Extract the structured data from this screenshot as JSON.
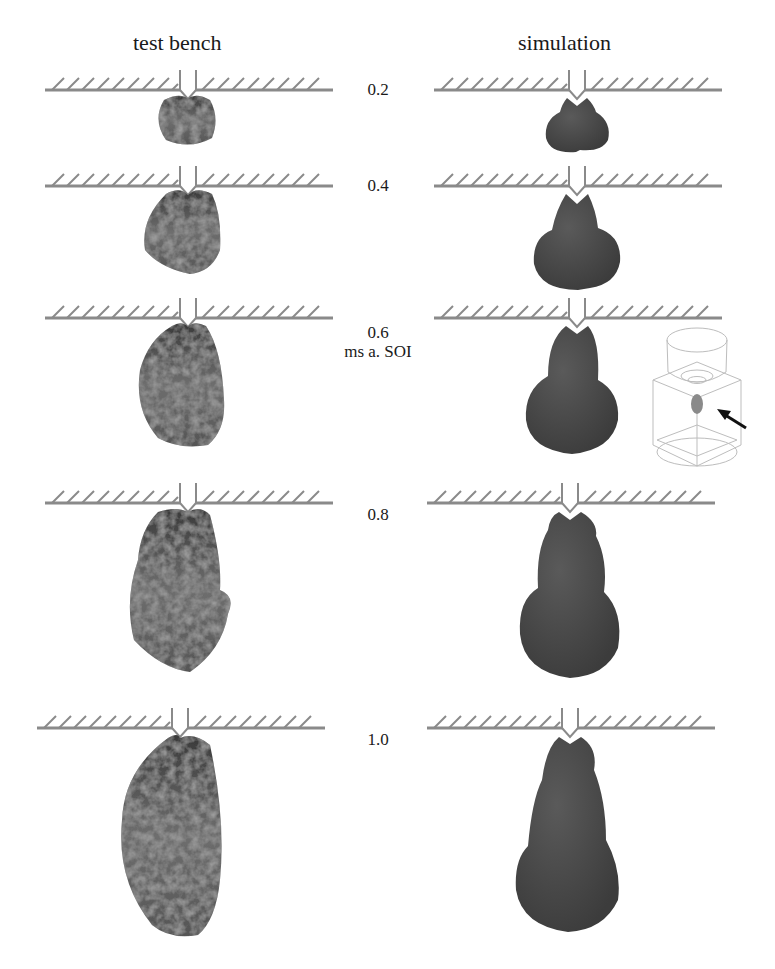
{
  "figure": {
    "columns": [
      {
        "id": "test-bench",
        "title": "test bench"
      },
      {
        "id": "simulation",
        "title": "simulation"
      }
    ],
    "time_unit_label": "ms a. SOI",
    "rows": [
      {
        "time": "0.2",
        "wall_y": 90
      },
      {
        "time": "0.4",
        "wall_y": 186
      },
      {
        "time": "0.6",
        "wall_y": 318
      },
      {
        "time": "0.8",
        "wall_y": 503
      },
      {
        "time": "1.0",
        "wall_y": 728
      }
    ],
    "inset": {
      "description": "3D chamber geometry with spray plume",
      "arrow": "pointer-arrow"
    },
    "colors": {
      "wall": "#8a8a8a",
      "spray_sim": "#4a4a4a",
      "spray_exp_dark": "#2a2a2a",
      "spray_exp_light": "#9a9a9a",
      "text": "#1a1a1a"
    }
  }
}
